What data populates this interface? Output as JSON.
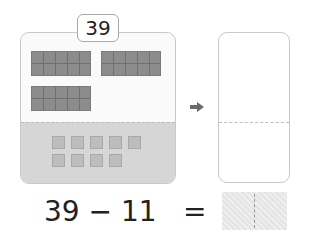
{
  "problem": {
    "start_number": "39",
    "expression": "39 − 11",
    "equals": "=",
    "answer": ""
  },
  "left_card": {
    "tens_blocks": 3,
    "ones_blocks": 9
  },
  "right_card": {
    "content": ""
  },
  "colors": {
    "tens_block": "#8c8c8c",
    "ones_block": "#bdbdbd",
    "card_bottom": "#d6d6d6",
    "arrow": "#6a6a6a"
  },
  "icons": {
    "arrow": "right-arrow-icon"
  }
}
